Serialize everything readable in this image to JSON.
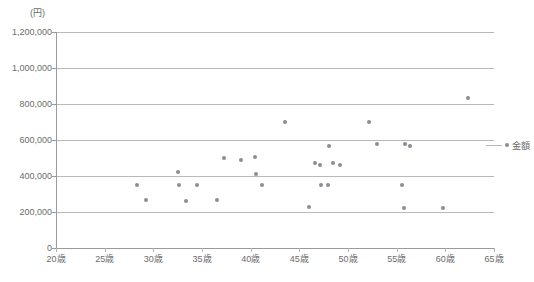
{
  "chart_data": {
    "type": "scatter",
    "title": "",
    "subtitle": "",
    "xlabel": "",
    "ylabel": "",
    "unit_label": "(円)",
    "xlim": [
      20,
      65
    ],
    "ylim": [
      0,
      1200000
    ],
    "grid": true,
    "legend_position": "right",
    "legend": [
      {
        "name": "金額",
        "marker": "dot",
        "color": "#8c8c96"
      }
    ],
    "xticks": [
      20,
      25,
      30,
      35,
      40,
      45,
      50,
      55,
      60,
      65
    ],
    "xticklabels": [
      "20歳",
      "25歳",
      "30歳",
      "35歳",
      "40歳",
      "45歳",
      "50歳",
      "55歳",
      "60歳",
      "65歳"
    ],
    "yticks": [
      0,
      200000,
      400000,
      600000,
      800000,
      1000000,
      1200000
    ],
    "yticklabels": [
      "0",
      "200,000",
      "400,000",
      "600,000",
      "800,000",
      "1,000,000",
      "1,200,000"
    ],
    "series": [
      {
        "name": "金額",
        "color": "#8c8c96",
        "points": [
          {
            "x": 28.3,
            "y": 350000
          },
          {
            "x": 29.2,
            "y": 265000
          },
          {
            "x": 32.5,
            "y": 420000
          },
          {
            "x": 32.6,
            "y": 350000
          },
          {
            "x": 33.4,
            "y": 260000
          },
          {
            "x": 34.5,
            "y": 350000
          },
          {
            "x": 36.5,
            "y": 265000
          },
          {
            "x": 37.3,
            "y": 500000
          },
          {
            "x": 39.0,
            "y": 490000
          },
          {
            "x": 40.4,
            "y": 505000
          },
          {
            "x": 40.5,
            "y": 410000
          },
          {
            "x": 41.2,
            "y": 350000
          },
          {
            "x": 43.5,
            "y": 700000
          },
          {
            "x": 46.0,
            "y": 230000
          },
          {
            "x": 46.6,
            "y": 470000
          },
          {
            "x": 47.1,
            "y": 460000
          },
          {
            "x": 47.2,
            "y": 350000
          },
          {
            "x": 47.9,
            "y": 350000
          },
          {
            "x": 48.0,
            "y": 565000
          },
          {
            "x": 48.5,
            "y": 475000
          },
          {
            "x": 49.2,
            "y": 460000
          },
          {
            "x": 52.2,
            "y": 700000
          },
          {
            "x": 53.0,
            "y": 580000
          },
          {
            "x": 55.5,
            "y": 350000
          },
          {
            "x": 55.8,
            "y": 225000
          },
          {
            "x": 55.9,
            "y": 580000
          },
          {
            "x": 56.4,
            "y": 565000
          },
          {
            "x": 59.8,
            "y": 220000
          },
          {
            "x": 62.3,
            "y": 835000
          }
        ]
      }
    ]
  },
  "legend_entry": {
    "label": "金額"
  }
}
